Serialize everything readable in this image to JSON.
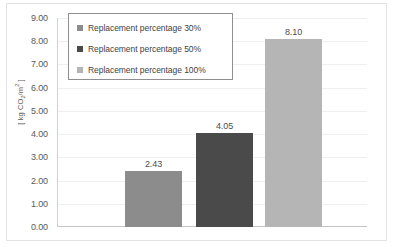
{
  "chart_data": {
    "type": "bar",
    "title": "",
    "xlabel": "",
    "ylabel": "[ kg CO2/m2 ]",
    "ylabel_parts": {
      "prefix": "[ kg CO",
      "sub": "2",
      "mid": "/m",
      "sup": "2",
      "suffix": " ]"
    },
    "categories": [
      "Replacement percentage 30%",
      "Replacement percentage 50%",
      "Replacement percentage 100%"
    ],
    "values": [
      2.43,
      4.05,
      8.1
    ],
    "value_labels": [
      "2.43",
      "4.05",
      "8.10"
    ],
    "ylim": [
      0.0,
      9.0
    ],
    "ytick_step": 1.0,
    "ytick_labels": [
      "9.00",
      "8.00",
      "7.00",
      "6.00",
      "5.00",
      "4.00",
      "3.00",
      "2.00",
      "1.00",
      "0.00"
    ],
    "ytick_values": [
      9,
      8,
      7,
      6,
      5,
      4,
      3,
      2,
      1,
      0
    ],
    "xtick_labels": [],
    "grid": true,
    "legend_position": "top-left",
    "colors": {
      "bar_30": "#8c8c8c",
      "bar_50": "#4a4a4a",
      "bar_100": "#b5b5b5",
      "gridline": "#efefef",
      "axis": "#c4c4c4",
      "label_text": "#4d4d4d",
      "tick_text": "#595959",
      "legend_border": "#8f8f8f",
      "chart_border": "#e3e3e3",
      "background": "#ffffff"
    }
  },
  "legend": {
    "items": [
      {
        "label": "Replacement percentage 30%",
        "color": "#8c8c8c"
      },
      {
        "label": "Replacement percentage 50%",
        "color": "#4a4a4a"
      },
      {
        "label": "Replacement percentage 100%",
        "color": "#b5b5b5"
      }
    ]
  }
}
